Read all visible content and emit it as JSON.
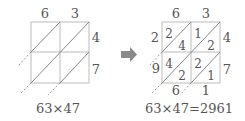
{
  "left": {
    "top_digits": [
      "6",
      "3"
    ],
    "right_digits": [
      "4",
      "7"
    ],
    "caption": "63×47"
  },
  "arrow": {
    "icon": "arrow-right-icon",
    "color": "#8a8a8a"
  },
  "right": {
    "top_digits": [
      "6",
      "3"
    ],
    "right_digits": [
      "4",
      "7"
    ],
    "cells": [
      {
        "row": 0,
        "col": 0,
        "tens": "2",
        "ones": "4"
      },
      {
        "row": 0,
        "col": 1,
        "tens": "1",
        "ones": "2"
      },
      {
        "row": 1,
        "col": 0,
        "tens": "4",
        "ones": "2"
      },
      {
        "row": 1,
        "col": 1,
        "tens": "2",
        "ones": "1"
      }
    ],
    "result_digits_left": [
      "2",
      "9"
    ],
    "result_digits_bottom": [
      "6",
      "1"
    ],
    "caption": "63×47=2961"
  },
  "colors": {
    "grid": "#b5b5b5",
    "diagonal": "#777777",
    "text": "#555555"
  }
}
